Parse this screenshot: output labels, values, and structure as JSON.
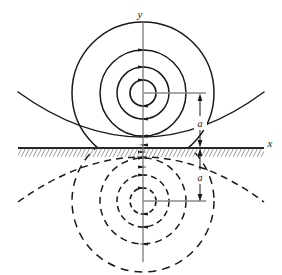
{
  "figure": {
    "width": 282,
    "height": 275,
    "background_color": "#ffffff",
    "line_color": "#1a1a1a",
    "leader_color": "#8a8a8a",
    "hatch_color": "#9a9a9a"
  },
  "axes": {
    "y_label": "y",
    "x_label": "x",
    "y_axis": {
      "x": 143,
      "y_top": 20,
      "y_bottom": 262
    },
    "x_axis": {
      "y": 148,
      "x_left": 18,
      "x_right": 264
    }
  },
  "plane": {
    "name": "conducting-plane",
    "y": 148,
    "x_left": 18,
    "x_right": 264,
    "hatching": "diagonal-below"
  },
  "sources": {
    "wire": {
      "label": "",
      "x": 143,
      "y": 93,
      "style": "solid"
    },
    "image_wire": {
      "label": "",
      "x": 143,
      "y": 201,
      "style": "dashed"
    }
  },
  "dimensions": [
    {
      "name": "distance-above",
      "label": "a",
      "x": 205,
      "y_from": 93,
      "y_to": 148,
      "label_x": 198,
      "label_y": 124
    },
    {
      "name": "distance-below",
      "label": "a",
      "x": 205,
      "y_from": 148,
      "y_to": 201,
      "label_x": 198,
      "label_y": 178
    }
  ],
  "leaders": [
    {
      "name": "leader-upper",
      "x_from": 143,
      "x_to": 205,
      "y": 93
    },
    {
      "name": "leader-lower",
      "x_from": 143,
      "x_to": 205,
      "y": 201
    }
  ],
  "field_lines_upper": {
    "style": "solid",
    "center_x": 143,
    "center_y": 93,
    "circles": [
      {
        "r": 13,
        "arrows": [
          "top-right",
          "bottom-left"
        ]
      },
      {
        "r": 26,
        "arrows": [
          "top-right",
          "bottom-left"
        ]
      },
      {
        "r": 43,
        "arrows": [
          "top-right",
          "bottom-left"
        ]
      },
      {
        "r": 71,
        "arrows": [
          "bottom-left"
        ],
        "clipped_top": true
      }
    ],
    "outer_arc": {
      "description": "large shallow arc approaching the plane",
      "apex_y": 136,
      "edge_y": 93
    }
  },
  "field_lines_lower": {
    "style": "dashed",
    "center_x": 143,
    "center_y": 201,
    "circles": [
      {
        "r": 13,
        "arrows": [
          "top-right",
          "bottom-left"
        ]
      },
      {
        "r": 26,
        "arrows": [
          "top-right",
          "bottom-left"
        ]
      },
      {
        "r": 43,
        "arrows": [
          "top-right",
          "bottom-left"
        ]
      },
      {
        "r": 71,
        "arrows": [
          "top-right"
        ],
        "clipped_bottom": true
      }
    ],
    "outer_arc": {
      "description": "large shallow dashed arc approaching the plane from below",
      "apex_y": 160,
      "edge_y": 201
    }
  },
  "arrow_direction": {
    "upper_top": "right",
    "upper_bottom": "left",
    "lower_top": "right",
    "lower_bottom": "left"
  }
}
